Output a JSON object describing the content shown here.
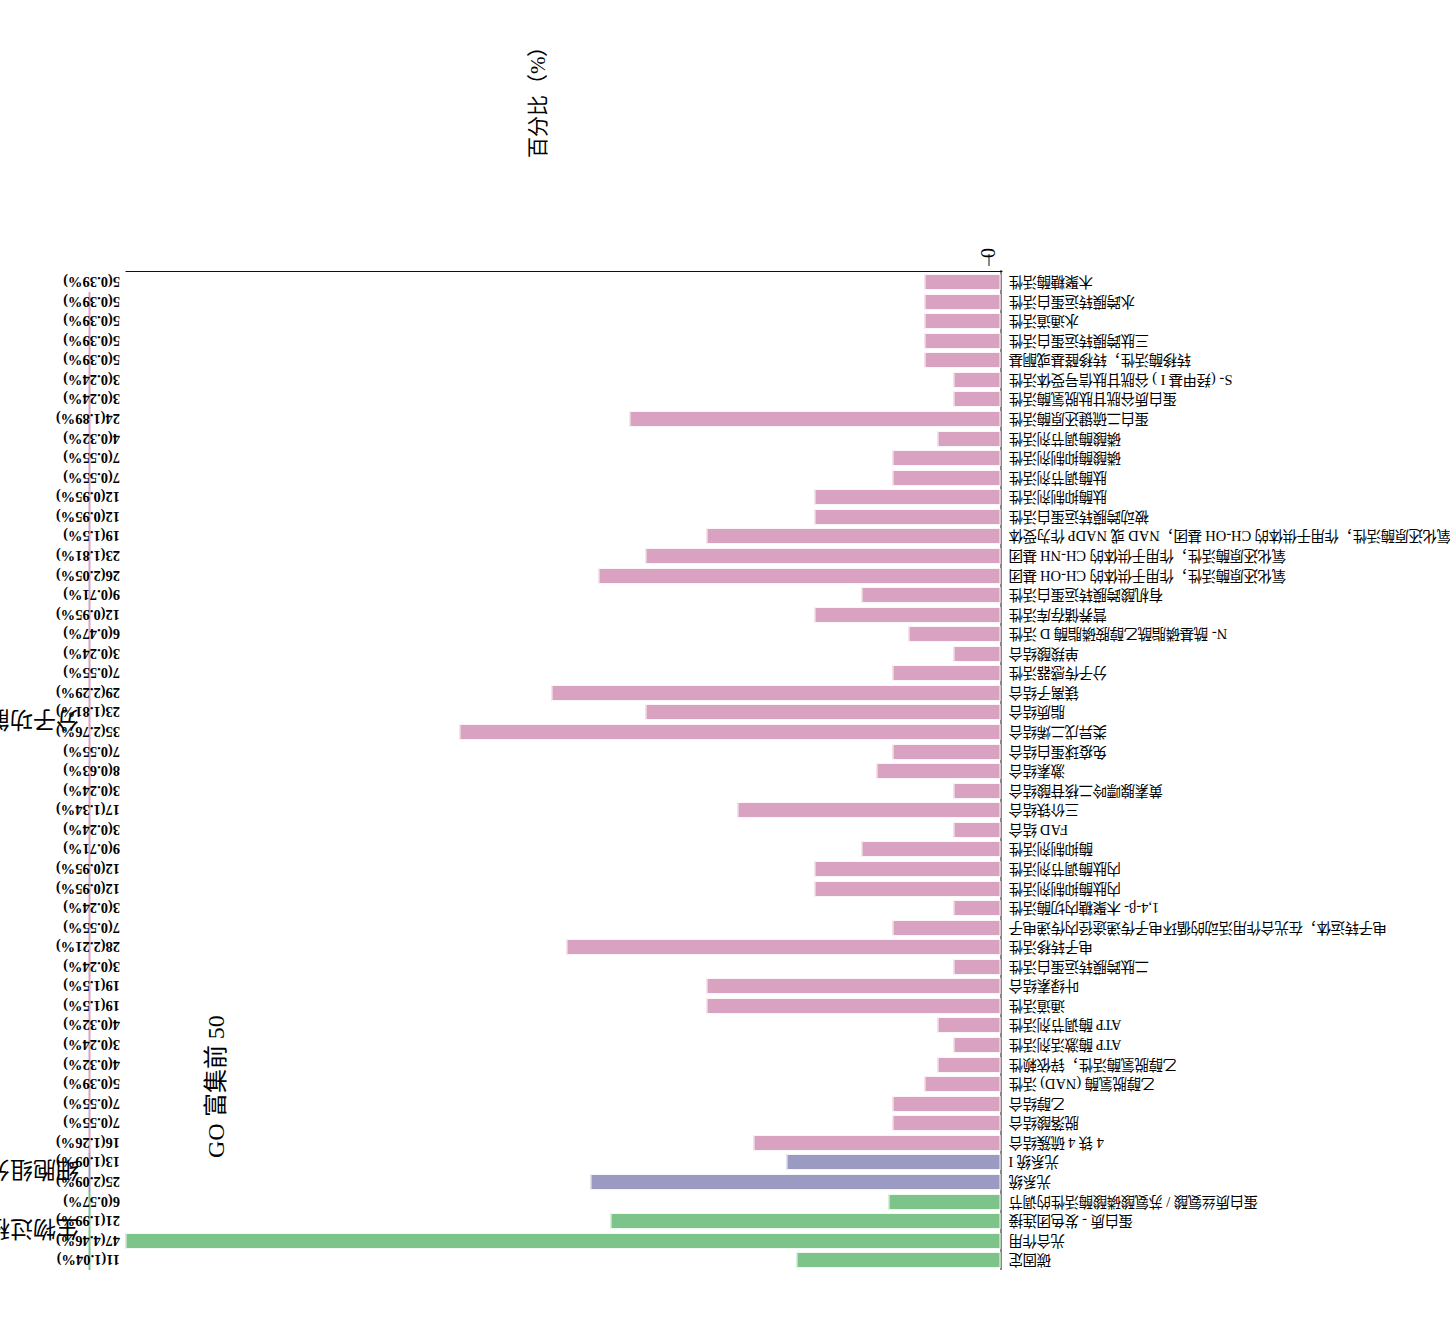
{
  "chart_data": {
    "type": "bar",
    "title": "GO 富集前 50",
    "xlabel": "",
    "ylabel": "百分比（%）",
    "ylim": [
      0,
      4.46
    ],
    "grid": false,
    "axis_ticks": [
      "0"
    ],
    "legend_position": "top",
    "groups": [
      {
        "name": "生物过程",
        "color": "#7cc48a",
        "count": 4
      },
      {
        "name": "细胞组分",
        "color": "#9a9ac3",
        "count": 2
      },
      {
        "name": "分子功能",
        "color": "#d9a2c0",
        "count": 44
      }
    ],
    "categories": [
      "碳固定",
      "光合作用",
      "蛋白质 - 发色团连接",
      "蛋白质丝氨酸 / 苏氨酸磷酸酶活性的调节",
      "光系统",
      "光系统 I",
      "4 铁 4 硫簇结合",
      "脱落酸结合",
      "乙醇结合",
      "乙醇脱氢酶 (NAD) 活性",
      "乙醇脱氢酶活性，锌依赖性",
      "ATP 酶激活剂活性",
      "ATP 酶调节剂活性",
      "通道活性",
      "叶绿素结合",
      "二肽跨膜转运蛋白活性",
      "电子转移活性",
      "电子转运体，在光合作用活动的循环电子传递途径内传递电子",
      "1,4-β- 木聚糖内切酶活性",
      "内肽酶抑制剂活性",
      "内肽酶调节剂活性",
      "酶抑制剂活性",
      "FAD 结合",
      "三价铁结合",
      "黄素腺嘌呤二核苷酸结合",
      "激素结合",
      "免疫球蛋白结合",
      "类异戊二烯结合",
      "脂质结合",
      "镁离子结合",
      "分子传感器活性",
      "单羧酸结合",
      "N- 酰基磷脂酰乙醇胺磷脂酶 D 活性",
      "营养储存库活性",
      "有机酸跨膜转运蛋白活性",
      "氧化还原酶活性，作用于供体的 CH-OH 基团",
      "氧化还原酶活性，作用于供体的 CH-NH 基团",
      "氧化还原酶活性，作用于供体的 CH-OH 基团，NAD 或 NADP 作为受体",
      "被动跨膜转运蛋白活性",
      "肽酶抑制剂活性",
      "肽酶调节剂活性",
      "磷酸酶抑制剂活性",
      "磷酸酶调节剂活性",
      "蛋白二硫键还原酶活性",
      "蛋白质谷胱甘肽脱氢酶活性",
      "S- (羟甲基 I ) 谷胱甘肽信号受体活性",
      "转移酶活性，转移醛基或酮基",
      "三肽跨膜转运蛋白活性",
      "水通道活性",
      "水跨膜转运蛋白活性",
      "木聚糖酶活性"
    ],
    "counts": [
      11,
      47,
      21,
      6,
      25,
      13,
      16,
      7,
      7,
      5,
      4,
      3,
      4,
      19,
      19,
      3,
      28,
      7,
      3,
      12,
      12,
      9,
      3,
      17,
      3,
      8,
      7,
      35,
      23,
      29,
      7,
      3,
      6,
      12,
      9,
      26,
      23,
      19,
      12,
      12,
      7,
      7,
      4,
      24,
      3,
      3,
      5,
      5,
      5
    ],
    "percents": [
      1.04,
      4.46,
      1.99,
      0.57,
      2.09,
      1.09,
      1.26,
      0.55,
      0.55,
      0.39,
      0.32,
      0.24,
      0.32,
      1.5,
      1.5,
      0.24,
      2.21,
      0.55,
      0.24,
      0.95,
      0.95,
      0.71,
      0.24,
      1.34,
      0.24,
      0.63,
      0.55,
      2.76,
      1.81,
      2.29,
      0.55,
      0.24,
      0.47,
      0.95,
      0.71,
      2.05,
      1.81,
      1.5,
      0.95,
      0.95,
      0.55,
      0.55,
      0.32,
      1.89,
      0.24,
      0.24,
      0.39,
      0.39,
      0.39
    ],
    "bars": [
      {
        "label": "碳固定",
        "count": 11,
        "percent": 1.04,
        "text": "11(1.04%)",
        "group": "bp"
      },
      {
        "label": "光合作用",
        "count": 47,
        "percent": 4.46,
        "text": "47(4.46%)",
        "group": "bp"
      },
      {
        "label": "蛋白质 - 发色团连接",
        "count": 21,
        "percent": 1.99,
        "text": "21(1.99%)",
        "group": "bp"
      },
      {
        "label": "蛋白质丝氨酸 / 苏氨酸磷酸酶活性的调节",
        "count": 6,
        "percent": 0.57,
        "text": "6(0.57%)",
        "group": "bp"
      },
      {
        "label": "光系统",
        "count": 25,
        "percent": 2.09,
        "text": "25(2.09%)",
        "group": "cc"
      },
      {
        "label": "光系统 I",
        "count": 13,
        "percent": 1.09,
        "text": "13(1.09%)",
        "group": "cc"
      },
      {
        "label": "4 铁 4 硫簇结合",
        "count": 16,
        "percent": 1.26,
        "text": "16(1.26%)",
        "group": "mf"
      },
      {
        "label": "脱落酸结合",
        "count": 7,
        "percent": 0.55,
        "text": "7(0.55%)",
        "group": "mf"
      },
      {
        "label": "乙醇结合",
        "count": 7,
        "percent": 0.55,
        "text": "7(0.55%)",
        "group": "mf"
      },
      {
        "label": "乙醇脱氢酶 (NAD) 活性",
        "count": 5,
        "percent": 0.39,
        "text": "5(0.39%)",
        "group": "mf"
      },
      {
        "label": "乙醇脱氢酶活性，锌依赖性",
        "count": 4,
        "percent": 0.32,
        "text": "4(0.32%)",
        "group": "mf"
      },
      {
        "label": "ATP 酶激活剂活性",
        "count": 3,
        "percent": 0.24,
        "text": "3(0.24%)",
        "group": "mf"
      },
      {
        "label": "ATP 酶调节剂活性",
        "count": 4,
        "percent": 0.32,
        "text": "4(0.32%)",
        "group": "mf"
      },
      {
        "label": "通道活性",
        "count": 19,
        "percent": 1.5,
        "text": "19(1.5%)",
        "group": "mf"
      },
      {
        "label": "叶绿素结合",
        "count": 19,
        "percent": 1.5,
        "text": "19(1.5%)",
        "group": "mf"
      },
      {
        "label": "二肽跨膜转运蛋白活性",
        "count": 3,
        "percent": 0.24,
        "text": "3(0.24%)",
        "group": "mf"
      },
      {
        "label": "电子转移活性",
        "count": 28,
        "percent": 2.21,
        "text": "28(2.21%)",
        "group": "mf"
      },
      {
        "label": "电子转运体，在光合作用活动的循环电子传递途径内传递电子",
        "count": 7,
        "percent": 0.55,
        "text": "7(0.55%)",
        "group": "mf"
      },
      {
        "label": "1,4-β- 木聚糖内切酶活性",
        "count": 3,
        "percent": 0.24,
        "text": "3(0.24%)",
        "group": "mf"
      },
      {
        "label": "内肽酶抑制剂活性",
        "count": 12,
        "percent": 0.95,
        "text": "12(0.95%)",
        "group": "mf"
      },
      {
        "label": "内肽酶调节剂活性",
        "count": 12,
        "percent": 0.95,
        "text": "12(0.95%)",
        "group": "mf"
      },
      {
        "label": "酶抑制剂活性",
        "count": 9,
        "percent": 0.71,
        "text": "9(0.71%)",
        "group": "mf"
      },
      {
        "label": "FAD 结合",
        "count": 3,
        "percent": 0.24,
        "text": "3(0.24%)",
        "group": "mf"
      },
      {
        "label": "三价铁结合",
        "count": 17,
        "percent": 1.34,
        "text": "17(1.34%)",
        "group": "mf"
      },
      {
        "label": "黄素腺嘌呤二核苷酸结合",
        "count": 3,
        "percent": 0.24,
        "text": "3(0.24%)",
        "group": "mf"
      },
      {
        "label": "激素结合",
        "count": 8,
        "percent": 0.63,
        "text": "8(0.63%)",
        "group": "mf"
      },
      {
        "label": "免疫球蛋白结合",
        "count": 7,
        "percent": 0.55,
        "text": "7(0.55%)",
        "group": "mf"
      },
      {
        "label": "类异戊二烯结合",
        "count": 35,
        "percent": 2.76,
        "text": "35(2.76%)",
        "group": "mf"
      },
      {
        "label": "脂质结合",
        "count": 23,
        "percent": 1.81,
        "text": "23(1.81%)",
        "group": "mf"
      },
      {
        "label": "镁离子结合",
        "count": 29,
        "percent": 2.29,
        "text": "29(2.29%)",
        "group": "mf"
      },
      {
        "label": "分子传感器活性",
        "count": 7,
        "percent": 0.55,
        "text": "7(0.55%)",
        "group": "mf"
      },
      {
        "label": "单羧酸结合",
        "count": 3,
        "percent": 0.24,
        "text": "3(0.24%)",
        "group": "mf"
      },
      {
        "label": "N- 酰基磷脂酰乙醇胺磷脂酶 D 活性",
        "count": 6,
        "percent": 0.47,
        "text": "6(0.47%)",
        "group": "mf"
      },
      {
        "label": "营养储存库活性",
        "count": 12,
        "percent": 0.95,
        "text": "12(0.95%)",
        "group": "mf"
      },
      {
        "label": "有机酸跨膜转运蛋白活性",
        "count": 9,
        "percent": 0.71,
        "text": "9(0.71%)",
        "group": "mf"
      },
      {
        "label": "氧化还原酶活性，作用于供体的 CH-OH 基团",
        "count": 26,
        "percent": 2.05,
        "text": "26(2.05%)",
        "group": "mf"
      },
      {
        "label": "氧化还原酶活性，作用于供体的 CH-NH 基团",
        "count": 23,
        "percent": 1.81,
        "text": "23(1.81%)",
        "group": "mf"
      },
      {
        "label": "氧化还原酶活性，作用于供体的 CH-OH 基团，NAD 或 NADP 作为受体",
        "count": 19,
        "percent": 1.5,
        "text": "19(1.5%)",
        "group": "mf"
      },
      {
        "label": "被动跨膜转运蛋白活性",
        "count": 12,
        "percent": 0.95,
        "text": "12(0.95%)",
        "group": "mf"
      },
      {
        "label": "肽酶抑制剂活性",
        "count": 12,
        "percent": 0.95,
        "text": "12(0.95%)",
        "group": "mf"
      },
      {
        "label": "肽酶调节剂活性",
        "count": 7,
        "percent": 0.55,
        "text": "7(0.55%)",
        "group": "mf"
      },
      {
        "label": "磷酸酶抑制剂活性",
        "count": 7,
        "percent": 0.55,
        "text": "7(0.55%)",
        "group": "mf"
      },
      {
        "label": "磷酸酶调节剂活性",
        "count": 4,
        "percent": 0.32,
        "text": "4(0.32%)",
        "group": "mf"
      },
      {
        "label": "蛋白二硫键还原酶活性",
        "count": 24,
        "percent": 1.89,
        "text": "24(1.89%)",
        "group": "mf"
      },
      {
        "label": "蛋白质谷胱甘肽脱氢酶活性",
        "count": 3,
        "percent": 0.24,
        "text": "3(0.24%)",
        "group": "mf"
      },
      {
        "label": "S- (羟甲基 I ) 谷胱甘肽信号受体活性",
        "count": 3,
        "percent": 0.24,
        "text": "3(0.24%)",
        "group": "mf"
      },
      {
        "label": "转移酶活性，转移醛基或酮基",
        "count": 5,
        "percent": 0.39,
        "text": "5(0.39%)",
        "group": "mf"
      },
      {
        "label": "三肽跨膜转运蛋白活性",
        "count": 5,
        "percent": 0.39,
        "text": "5(0.39%)",
        "group": "mf"
      },
      {
        "label": "水通道活性",
        "count": 5,
        "percent": 0.39,
        "text": "5(0.39%)",
        "group": "mf"
      },
      {
        "label": "水跨膜转运蛋白活性",
        "count": 5,
        "percent": 0.39,
        "text": "5(0.39%)",
        "group": "mf"
      },
      {
        "label": "木聚糖酶活性",
        "count": 5,
        "percent": 0.39,
        "text": "5(0.39%)",
        "group": "mf"
      }
    ]
  }
}
